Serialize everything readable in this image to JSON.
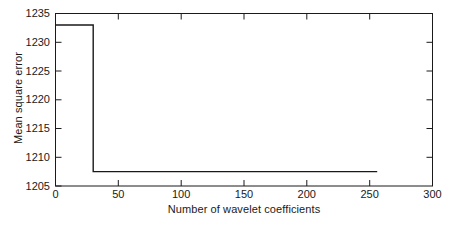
{
  "chart_data": {
    "type": "line",
    "title": "",
    "xlabel": "Number of wavelet coefficients",
    "ylabel": "Mean square error",
    "xlim": [
      0,
      300
    ],
    "ylim": [
      1205,
      1235
    ],
    "xticks": [
      0,
      50,
      100,
      150,
      200,
      250,
      300
    ],
    "xtick_labels": [
      "0",
      "50",
      "100",
      "150",
      "200",
      "250",
      "300"
    ],
    "yticks": [
      1205,
      1210,
      1215,
      1220,
      1225,
      1230,
      1235
    ],
    "ytick_labels": [
      "1205",
      "1210",
      "1215",
      "1220",
      "1225",
      "1230",
      "1235"
    ],
    "grid": false,
    "legend": null,
    "box": true,
    "tick_direction": "in",
    "line_color": "#1a1a1a",
    "line_width": 1.4,
    "series": [
      {
        "name": "Mean square error vs wavelet coefficients",
        "x": [
          0,
          30,
          30,
          256
        ],
        "values": [
          1233,
          1233,
          1207.5,
          1207.5
        ]
      }
    ],
    "annotations": []
  },
  "axes": {
    "ylabel_text": "Mean square error",
    "xlabel_text": "Number of wavelet coefficients"
  }
}
